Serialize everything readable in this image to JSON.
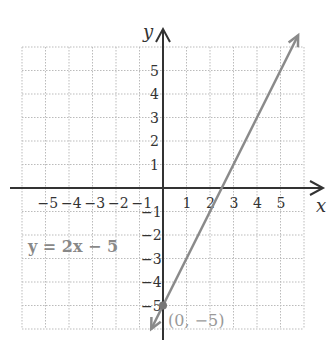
{
  "chart_data": {
    "type": "line",
    "title": "",
    "xlabel": "x",
    "ylabel": "y",
    "xlim": [
      -6,
      6
    ],
    "ylim": [
      -6,
      6
    ],
    "grid": true,
    "x_ticks": [
      "−5",
      "−4",
      "−3",
      "−2",
      "−1",
      "1",
      "2",
      "3",
      "4",
      "5"
    ],
    "y_ticks": [
      "5",
      "4",
      "3",
      "2",
      "1",
      "−1",
      "−2",
      "−3",
      "−4",
      "−5"
    ],
    "series": [
      {
        "name": "y = 2x − 5",
        "equation": "y = 2x − 5",
        "x": [
          -0.5,
          5.75
        ],
        "y": [
          -6,
          6.5
        ],
        "color": "#8a8a8a"
      }
    ],
    "annotations": [
      {
        "text": "(0, −5)",
        "x": 0,
        "y": -5,
        "type": "point"
      },
      {
        "text": "y = 2x − 5",
        "x": -4.5,
        "y": -2.5,
        "type": "label"
      }
    ]
  },
  "labels": {
    "x_axis": "x",
    "y_axis": "y",
    "equation": "y = 2x − 5",
    "point": "(0, −5)"
  },
  "colors": {
    "line": "#8a8a8a",
    "axis": "#333333",
    "grid": "#bbbbbb"
  }
}
